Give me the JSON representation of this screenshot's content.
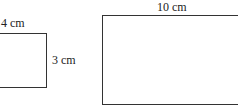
{
  "figure": {
    "small_rectangle": {
      "width_label": "4 cm",
      "height_label": "3 cm"
    },
    "large_rectangle": {
      "width_label": "10 cm"
    }
  },
  "colors": {
    "stroke": "#333333",
    "text": "#222222",
    "background": "#ffffff"
  }
}
